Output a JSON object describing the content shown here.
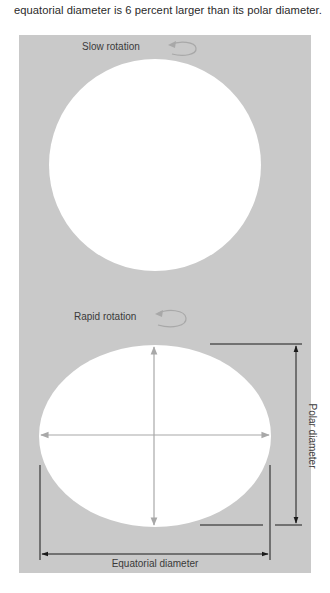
{
  "caption": "equatorial diameter is 6 percent larger than its polar diameter.",
  "colors": {
    "panel": "#c9c9c9",
    "body": "#ffffff",
    "axis_arrow": "#a8a8a8",
    "dimension_line": "#1a1a1a",
    "label": "#3a3a3a"
  },
  "diagrams": [
    {
      "label": "Slow rotation",
      "shape": "circle",
      "icon": "rotation-arrow-icon"
    },
    {
      "label": "Rapid rotation",
      "shape": "oblate-ellipse",
      "icon": "rotation-arrow-icon",
      "dimensions": {
        "polar": "Polar diameter",
        "equatorial": "Equatorial diameter"
      }
    }
  ]
}
